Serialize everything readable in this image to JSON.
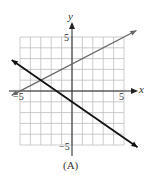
{
  "figure": {
    "caption": "(A)",
    "x_axis_label": "x",
    "y_axis_label": "y",
    "tick_labels": {
      "x_pos": "5",
      "x_neg": "−5",
      "y_pos": "5",
      "y_neg": "−5"
    },
    "colors": {
      "grid": "#bfbfbf",
      "axes": "#222222",
      "line_gray": "#666666",
      "line_black": "#111111"
    }
  },
  "chart_data": {
    "type": "line",
    "title": "",
    "caption": "(A)",
    "xlabel": "x",
    "ylabel": "y",
    "xlim": [
      -5,
      5
    ],
    "ylim": [
      -5,
      5
    ],
    "grid": true,
    "grid_step": 1,
    "tick_labels_x": [
      "-5",
      "5"
    ],
    "tick_labels_y": [
      "-5",
      "5"
    ],
    "series": [
      {
        "name": "gray line (rising)",
        "equation": "y = 0.5x + 2.5",
        "color": "#666666",
        "x": [
          -5.8,
          6.2
        ],
        "y": [
          -0.4,
          5.6
        ]
      },
      {
        "name": "black line (falling)",
        "equation": "y = -(2/3)x - 1",
        "color": "#111111",
        "x": [
          -5.8,
          6.3
        ],
        "y": [
          2.87,
          -5.2
        ]
      }
    ],
    "intersection": {
      "x": -3,
      "y": 1
    }
  }
}
